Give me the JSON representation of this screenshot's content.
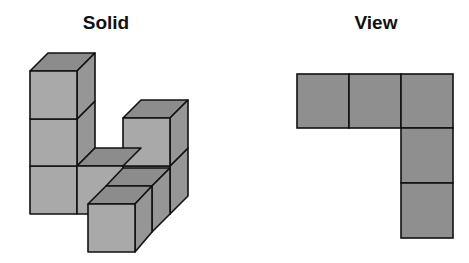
{
  "titles": {
    "solid": "Solid",
    "view": "View"
  },
  "colors": {
    "front": "#a9a9a9",
    "top": "#8c8c8c",
    "side": "#969696",
    "view_cell": "#8f8f8f",
    "stroke": "#111111"
  },
  "solid": {
    "description": "Isometric-style arrangement of 7 unit cubes: a column of 3 on the back-left, a stack of 2 on the back-right, one cube between them at the base, and one cube protruding toward the front at the base.",
    "cube_count": 7
  },
  "view": {
    "description": "Top view: L-shape of 5 squares — a row of 3 along the top, and 2 more stacked below the rightmost square.",
    "grid_rows": 3,
    "grid_cols": 3,
    "cells": [
      [
        1,
        1,
        1
      ],
      [
        0,
        0,
        1
      ],
      [
        0,
        0,
        1
      ]
    ]
  }
}
